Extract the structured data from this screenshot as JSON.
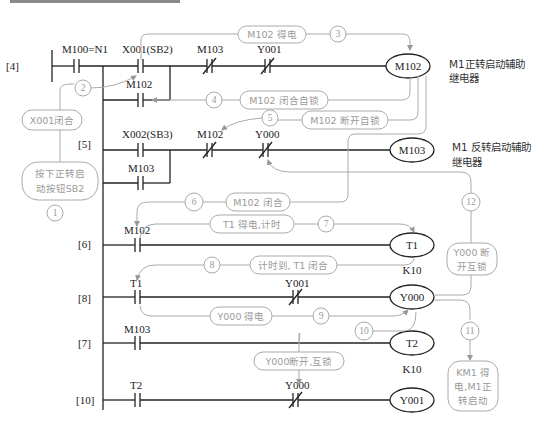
{
  "diagram": {
    "type": "PLC ladder diagram",
    "rungs": [
      {
        "label": "[4]",
        "contacts": [
          {
            "name": "M100=N1",
            "type": "NO"
          },
          {
            "name": "X001(SB2)",
            "type": "NO"
          },
          {
            "name": "M103",
            "type": "NC"
          },
          {
            "name": "Y001",
            "type": "NC"
          }
        ],
        "branch": {
          "name": "M102",
          "type": "NO"
        },
        "coil": "M102",
        "description": [
          "M1正转启动辅助",
          "继电器"
        ]
      },
      {
        "label": "[5]",
        "contacts": [
          {
            "name": "X002(SB3)",
            "type": "NO"
          },
          {
            "name": "M102",
            "type": "NC"
          },
          {
            "name": "Y000",
            "type": "NC"
          }
        ],
        "branch": {
          "name": "M103",
          "type": "NO"
        },
        "coil": "M103",
        "description": [
          "M1 反转启动辅助",
          "继电器"
        ]
      },
      {
        "label": "[6]",
        "contacts": [
          {
            "name": "M102",
            "type": "NO"
          }
        ],
        "coil": "T1",
        "setting": "K10"
      },
      {
        "label": "[8]",
        "contacts": [
          {
            "name": "T1",
            "type": "NO"
          },
          {
            "name": "Y001",
            "type": "NC"
          }
        ],
        "coil": "Y000"
      },
      {
        "label": "[7]",
        "contacts": [
          {
            "name": "M103",
            "type": "NO"
          }
        ],
        "coil": "T2",
        "setting": "K10"
      },
      {
        "label": "[10]",
        "contacts": [
          {
            "name": "T2",
            "type": "NO"
          },
          {
            "name": "Y000",
            "type": "NC"
          }
        ],
        "coil": "Y001"
      }
    ]
  },
  "annotations": {
    "steps": [
      "1",
      "2",
      "3",
      "4",
      "5",
      "6",
      "7",
      "8",
      "9",
      "10",
      "11",
      "12"
    ],
    "notes": {
      "press_sb2": [
        "按下正转启",
        "动按钮SB2"
      ],
      "x001_close": "X001闭合",
      "m102_energized": "M102 得电",
      "m102_self_lock": "M102 闭合自锁",
      "m102_break_lock": "M102 断开自锁",
      "m102_close": "M102 闭合",
      "t1_timing": "T1  得电,计时",
      "t1_done": "计时到, T1 闭合",
      "y000_energized": "Y000  得电",
      "y000_interlock_open": "Y000断开,互锁",
      "y000_break_interlock": [
        "Y000 断",
        "开互锁"
      ],
      "km1_start": [
        "KM1 得",
        "电,M1正",
        "转启动"
      ]
    }
  }
}
